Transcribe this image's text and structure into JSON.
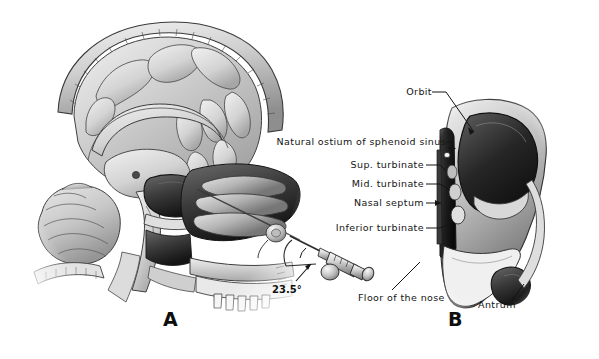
{
  "figure": {
    "title_alt": "Sagittal and coronal anatomical sections of the nasal cavity and paranasal sinuses",
    "background_color": "#ffffff",
    "ink_color": "#141414"
  },
  "panels": [
    {
      "id": "A",
      "letter": "A",
      "caption_alt": "Mid-sagittal section of head showing brain, sphenoid sinus and needle trajectory"
    },
    {
      "id": "B",
      "letter": "B",
      "caption_alt": "Coronal view of lateral nasal wall structures"
    }
  ],
  "annotations": {
    "angle": {
      "value": "23.5°"
    }
  },
  "labels": [
    {
      "key": "orbit",
      "text": "Orbit"
    },
    {
      "key": "natural_ostium",
      "text": "Natural ostium of sphenoid sinus"
    },
    {
      "key": "sup_turbinate",
      "text": "Sup. turbinate"
    },
    {
      "key": "mid_turbinate",
      "text": "Mid. turbinate"
    },
    {
      "key": "nasal_septum",
      "text": "Nasal septum"
    },
    {
      "key": "inferior_turbinate",
      "text": "Inferior turbinate"
    },
    {
      "key": "floor_of_nose",
      "text": "Floor of the nose"
    },
    {
      "key": "antrum",
      "text": "Antrum"
    }
  ]
}
